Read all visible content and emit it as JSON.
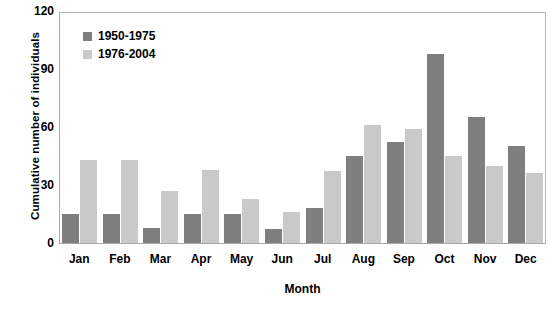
{
  "chart_data": {
    "type": "bar",
    "title": "",
    "xlabel": "Month",
    "ylabel": "Cumulative number of individuals",
    "categories": [
      "Jan",
      "Feb",
      "Mar",
      "Apr",
      "May",
      "Jun",
      "Jul",
      "Aug",
      "Sep",
      "Oct",
      "Nov",
      "Dec"
    ],
    "series": [
      {
        "name": "1950-1975",
        "color": "#7f7f7f",
        "values": [
          15,
          15,
          8,
          15,
          15,
          7,
          18,
          45,
          52,
          98,
          65,
          50
        ]
      },
      {
        "name": "1976-2004",
        "color": "#c9c9c9",
        "values": [
          43,
          43,
          27,
          38,
          23,
          16,
          37,
          61,
          59,
          45,
          40,
          36
        ]
      }
    ],
    "ylim": [
      0,
      120
    ],
    "yticks": [
      0,
      30,
      60,
      90,
      120
    ],
    "ytick_labels": [
      "0",
      "30",
      "60",
      "90",
      "120"
    ],
    "grid": false,
    "legend_position": "top-left"
  },
  "legend": {
    "entries": [
      {
        "label": "1950-1975",
        "swatch": "dark"
      },
      {
        "label": "1976-2004",
        "swatch": "light"
      }
    ]
  }
}
